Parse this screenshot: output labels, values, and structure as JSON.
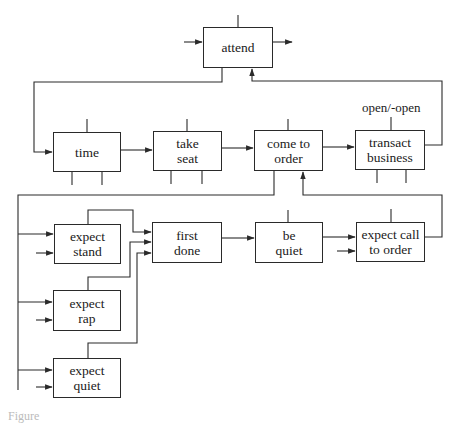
{
  "diagram": {
    "nodes": [
      {
        "id": "attend",
        "label": "attend",
        "x": 203,
        "y": 27,
        "w": 70,
        "h": 41
      },
      {
        "id": "time",
        "label": "time",
        "x": 53,
        "y": 132,
        "w": 68,
        "h": 40
      },
      {
        "id": "take_seat",
        "label": "take\nseat",
        "x": 153,
        "y": 131,
        "w": 69,
        "h": 40
      },
      {
        "id": "come_to_order",
        "label": "come to\norder",
        "x": 254,
        "y": 130,
        "w": 69,
        "h": 41
      },
      {
        "id": "transact_business",
        "label": "transact\nbusiness",
        "x": 355,
        "y": 130,
        "w": 70,
        "h": 40
      },
      {
        "id": "expect_stand",
        "label": "expect\nstand",
        "x": 54,
        "y": 224,
        "w": 67,
        "h": 40
      },
      {
        "id": "first_done",
        "label": "first\ndone",
        "x": 152,
        "y": 222,
        "w": 70,
        "h": 41
      },
      {
        "id": "be_quiet",
        "label": "be\nquiet",
        "x": 255,
        "y": 222,
        "w": 68,
        "h": 41
      },
      {
        "id": "expect_call_to_order",
        "label": "expect call\nto order",
        "x": 356,
        "y": 222,
        "w": 69,
        "h": 40
      },
      {
        "id": "expect_rap",
        "label": "expect\nrap",
        "x": 53,
        "y": 290,
        "w": 68,
        "h": 41
      },
      {
        "id": "expect_quiet",
        "label": "expect\nquiet",
        "x": 53,
        "y": 358,
        "w": 68,
        "h": 40
      }
    ],
    "annotations": {
      "open_label": "open/-open"
    },
    "edges": [
      {
        "from": "attend",
        "to": "time"
      },
      {
        "from": "transact_business",
        "to": "attend"
      },
      {
        "from": "time",
        "to": "take_seat"
      },
      {
        "from": "take_seat",
        "to": "come_to_order"
      },
      {
        "from": "come_to_order",
        "to": "transact_business"
      },
      {
        "from": "come_to_order",
        "to": "expect_stand"
      },
      {
        "from": "come_to_order",
        "to": "expect_rap"
      },
      {
        "from": "come_to_order",
        "to": "expect_quiet"
      },
      {
        "from": "expect_stand",
        "to": "first_done"
      },
      {
        "from": "expect_rap",
        "to": "first_done"
      },
      {
        "from": "expect_quiet",
        "to": "first_done"
      },
      {
        "from": "first_done",
        "to": "be_quiet"
      },
      {
        "from": "be_quiet",
        "to": "expect_call_to_order"
      },
      {
        "from": "expect_call_to_order",
        "to": "come_to_order"
      }
    ],
    "caption": "Figure"
  },
  "style": {
    "line_color": "#2a2a2a",
    "background": "#ffffff"
  }
}
